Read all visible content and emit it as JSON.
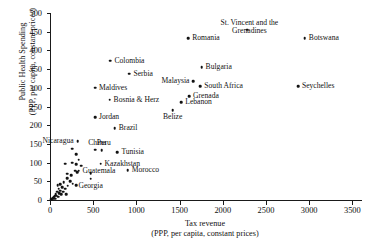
{
  "chart_data": {
    "type": "scatter",
    "title": "",
    "xlabel": "Tax revenue\n(PPP, per capita, constant prices)",
    "ylabel": "Public Health Spending\n(PPP, per capita, constant prices)",
    "xlim": [
      0,
      3600
    ],
    "ylim": [
      0,
      500
    ],
    "xticks": [
      0,
      500,
      1000,
      1500,
      2000,
      2500,
      3000,
      3500
    ],
    "yticks": [
      0,
      50,
      100,
      150,
      200,
      250,
      300,
      350,
      400,
      450,
      500
    ],
    "grid": false,
    "legend": "none",
    "marker_color": "#121212",
    "axis_color": "#1a1a1a",
    "labeled_points": [
      {
        "name": "Romania",
        "x": 1600,
        "y": 432,
        "label_side": "right"
      },
      {
        "name": "St. Vincent and the\nGrenadines",
        "x": 2285,
        "y": 455,
        "label_side": "center-above"
      },
      {
        "name": "Botswana",
        "x": 2950,
        "y": 432,
        "label_side": "right"
      },
      {
        "name": "Bulgaria",
        "x": 1755,
        "y": 355,
        "label_side": "right"
      },
      {
        "name": "Colombia",
        "x": 700,
        "y": 372,
        "label_side": "right"
      },
      {
        "name": "Serbia",
        "x": 920,
        "y": 338,
        "label_side": "right"
      },
      {
        "name": "Malaysia",
        "x": 1660,
        "y": 318,
        "label_side": "left"
      },
      {
        "name": "South Africa",
        "x": 1740,
        "y": 305,
        "label_side": "right"
      },
      {
        "name": "Seychelles",
        "x": 2870,
        "y": 305,
        "label_side": "right"
      },
      {
        "name": "Maldives",
        "x": 520,
        "y": 300,
        "label_side": "right"
      },
      {
        "name": "Grenada",
        "x": 1610,
        "y": 277,
        "label_side": "right"
      },
      {
        "name": "Bosnia & Herz",
        "x": 690,
        "y": 268,
        "label_side": "right"
      },
      {
        "name": "Lebanon",
        "x": 1520,
        "y": 262,
        "label_side": "right"
      },
      {
        "name": "Belize",
        "x": 1420,
        "y": 240,
        "label_side": "below"
      },
      {
        "name": "Jordan",
        "x": 520,
        "y": 222,
        "label_side": "right"
      },
      {
        "name": "Brazil",
        "x": 750,
        "y": 192,
        "label_side": "right"
      },
      {
        "name": "Nicaragua",
        "x": 320,
        "y": 157,
        "label_side": "left"
      },
      {
        "name": "China",
        "x": 525,
        "y": 135,
        "label_side": "center-above"
      },
      {
        "name": "Peru",
        "x": 600,
        "y": 133,
        "label_side": "center-above"
      },
      {
        "name": "Tunisia",
        "x": 780,
        "y": 128,
        "label_side": "right"
      },
      {
        "name": "Kazakhstan",
        "x": 585,
        "y": 97,
        "label_side": "right"
      },
      {
        "name": "Guatemala",
        "x": 330,
        "y": 78,
        "label_side": "right"
      },
      {
        "name": "Morocco",
        "x": 900,
        "y": 80,
        "label_side": "right"
      },
      {
        "name": "Georgia",
        "x": 470,
        "y": 57,
        "label_side": "below"
      }
    ],
    "unlabeled_points": [
      {
        "x": 255,
        "y": 137
      },
      {
        "x": 300,
        "y": 122
      },
      {
        "x": 175,
        "y": 97
      },
      {
        "x": 255,
        "y": 100
      },
      {
        "x": 300,
        "y": 96
      },
      {
        "x": 360,
        "y": 92
      },
      {
        "x": 290,
        "y": 78
      },
      {
        "x": 315,
        "y": 75
      },
      {
        "x": 470,
        "y": 72
      },
      {
        "x": 200,
        "y": 58
      },
      {
        "x": 235,
        "y": 50
      },
      {
        "x": 160,
        "y": 47
      },
      {
        "x": 265,
        "y": 44
      },
      {
        "x": 120,
        "y": 42
      },
      {
        "x": 205,
        "y": 38
      },
      {
        "x": 305,
        "y": 40
      },
      {
        "x": 140,
        "y": 34
      },
      {
        "x": 175,
        "y": 30
      },
      {
        "x": 100,
        "y": 30
      },
      {
        "x": 120,
        "y": 25
      },
      {
        "x": 150,
        "y": 22
      },
      {
        "x": 85,
        "y": 22
      },
      {
        "x": 105,
        "y": 18
      },
      {
        "x": 65,
        "y": 16
      },
      {
        "x": 130,
        "y": 15
      },
      {
        "x": 75,
        "y": 12
      },
      {
        "x": 55,
        "y": 10
      },
      {
        "x": 95,
        "y": 9
      },
      {
        "x": 45,
        "y": 7
      },
      {
        "x": 35,
        "y": 5
      },
      {
        "x": 25,
        "y": 4
      },
      {
        "x": 60,
        "y": 4
      },
      {
        "x": 15,
        "y": 2
      },
      {
        "x": 200,
        "y": 70
      },
      {
        "x": 245,
        "y": 66
      },
      {
        "x": 185,
        "y": 15
      },
      {
        "x": 90,
        "y": 40
      },
      {
        "x": 330,
        "y": 108
      }
    ]
  }
}
